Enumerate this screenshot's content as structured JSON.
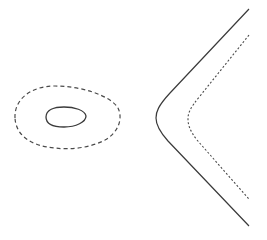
{
  "diagram": {
    "background": "#ffffff",
    "stroke_color": "#3a3a3a",
    "curves": [
      {
        "id": "inner-loop",
        "style": "solid",
        "description": "small closed egg-shaped loop",
        "path": "M 46 117 C 46 110, 54 107, 64 107 C 74 107, 85 110, 86 116 C 86 122, 76 127, 64 127 C 52 127, 46 123, 46 117 Z"
      },
      {
        "id": "outer-loop",
        "style": "dashed",
        "description": "larger closed dashed loop around inner loop",
        "path": "M 15 118 C 14 100, 30 86, 55 86 C 80 86, 110 95, 118 108 C 123 118, 119 132, 105 140 C 90 148, 70 150, 55 148 C 30 146, 16 135, 15 118 Z"
      },
      {
        "id": "solid-branch",
        "style": "solid",
        "description": "hyperbola-like open branch opening to the right",
        "path": "M 249 9 L 170 93 C 158 106, 156 112, 156 118 C 156 125, 159 131, 168 141 L 249 226"
      },
      {
        "id": "dotted-branch",
        "style": "dotted",
        "description": "dotted open branch parallel to solid branch",
        "path": "M 249 35 L 200 96 C 190 108, 188 113, 188 119 C 188 125, 190 131, 197 140 L 249 199"
      }
    ]
  }
}
